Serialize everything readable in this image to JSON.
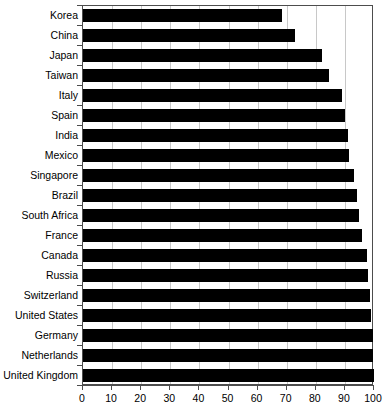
{
  "chart_data": {
    "type": "bar",
    "orientation": "horizontal",
    "title": "",
    "xlabel": "",
    "ylabel": "",
    "xlim": [
      0,
      100
    ],
    "xticks": [
      0,
      10,
      20,
      30,
      40,
      50,
      60,
      70,
      80,
      90,
      100
    ],
    "grid": true,
    "legend": false,
    "bar_color": "#000000",
    "grid_color": "#c8c8c8",
    "axis_color": "#4d4d4d",
    "categories": [
      "Korea",
      "China",
      "Japan",
      "Taiwan",
      "Italy",
      "Spain",
      "India",
      "Mexico",
      "Singapore",
      "Brazil",
      "South Africa",
      "France",
      "Canada",
      "Russia",
      "Switzerland",
      "United States",
      "Germany",
      "Netherlands",
      "United Kingdom"
    ],
    "values": [
      68.5,
      73,
      82,
      84.5,
      89,
      90,
      91,
      91.5,
      93,
      94,
      95,
      96,
      97.5,
      98,
      98.5,
      99,
      99.5,
      99.5,
      100
    ]
  }
}
